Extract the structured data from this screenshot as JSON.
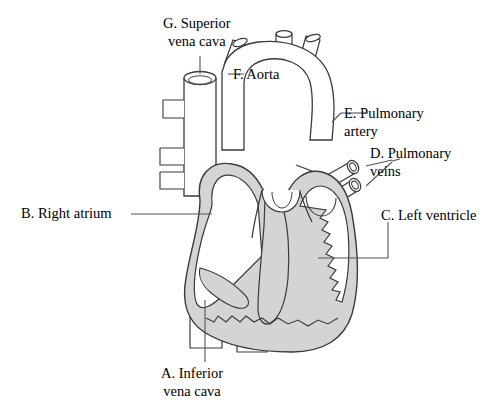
{
  "diagram": {
    "background_color": "#ffffff",
    "outline_color": "#3a3a3a",
    "muscle_fill_color": "#d4d4d4",
    "chamber_fill_color": "#ffffff",
    "leader_line_color": "#555555"
  },
  "labels": {
    "inferior_vena_cava": {
      "letter": "A.",
      "line1": "A. Inferior",
      "line2": "vena cava"
    },
    "right_atrium": {
      "letter": "B.",
      "line1": "B. Right atrium",
      "line2": ""
    },
    "left_ventricle": {
      "letter": "C.",
      "line1": "C. Left ventricle",
      "line2": ""
    },
    "pulmonary_veins": {
      "letter": "D.",
      "line1": "D. Pulmonary",
      "line2": "veins"
    },
    "pulmonary_artery": {
      "letter": "E.",
      "line1": "E. Pulmonary",
      "line2": "artery"
    },
    "aorta": {
      "letter": "F.",
      "line1": "F. Aorta",
      "line2": ""
    },
    "superior_vena_cava": {
      "letter": "G.",
      "line1": "G. Superior",
      "line2": "vena cava"
    }
  }
}
